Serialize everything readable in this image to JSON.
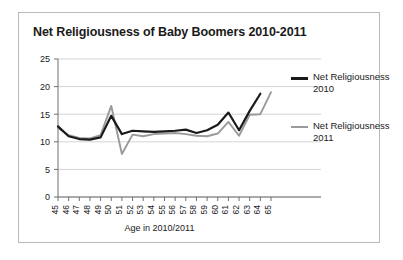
{
  "chart_data": {
    "type": "line",
    "title": "Net Religiousness of Baby Boomers 2010-2011",
    "xlabel": "Age in 2010/2011",
    "ylabel": "",
    "categories": [
      "45",
      "46",
      "47",
      "48",
      "49",
      "50",
      "51",
      "52",
      "53",
      "54",
      "55",
      "56",
      "57",
      "58",
      "59",
      "60",
      "61",
      "62",
      "63",
      "64",
      "65"
    ],
    "x": [
      45,
      46,
      47,
      48,
      49,
      50,
      51,
      52,
      53,
      54,
      55,
      56,
      57,
      58,
      59,
      60,
      61,
      62,
      63,
      64,
      65
    ],
    "ylim": [
      0,
      25
    ],
    "yticks": [
      0,
      5,
      10,
      15,
      20,
      25
    ],
    "grid": true,
    "legend_position": "right",
    "series": [
      {
        "name": "Net Religiousness 2010",
        "color": "#1a1a1a",
        "values": [
          12.8,
          11.0,
          10.5,
          10.4,
          10.8,
          14.7,
          11.4,
          12.0,
          11.9,
          11.8,
          11.9,
          12.0,
          12.2,
          11.6,
          12.1,
          13.1,
          15.3,
          12.1,
          15.6,
          18.7,
          null
        ]
      },
      {
        "name": "Net Religiousness 2011",
        "color": "#9a9a9a",
        "values": [
          12.5,
          11.2,
          10.7,
          10.6,
          11.2,
          16.5,
          7.8,
          11.3,
          11.0,
          11.4,
          11.5,
          11.6,
          11.4,
          11.1,
          11.0,
          11.5,
          13.6,
          11.1,
          14.9,
          15.0,
          19.0
        ]
      }
    ]
  },
  "legend": {
    "items": [
      {
        "label_line1": "Net Religiousness",
        "label_line2": "2010"
      },
      {
        "label_line1": "Net Religiousness",
        "label_line2": "2011"
      }
    ]
  },
  "colors": {
    "series_2010": "#1a1a1a",
    "series_2011": "#9a9a9a",
    "grid": "#d4d4d4",
    "axis": "#6f6f6f",
    "frame_border": "#b9b9b9",
    "background": "#ffffff"
  }
}
